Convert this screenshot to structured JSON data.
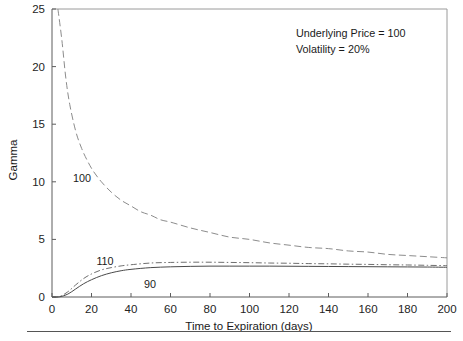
{
  "chart_data": {
    "type": "line",
    "title": "",
    "xlabel": "Time to Expiration (days)",
    "ylabel": "Gamma",
    "xlim": [
      0,
      200
    ],
    "ylim": [
      0,
      25
    ],
    "xticks": [
      0,
      20,
      40,
      60,
      80,
      100,
      120,
      140,
      160,
      180,
      200
    ],
    "yticks": [
      0,
      5,
      10,
      15,
      20,
      25
    ],
    "grid": false,
    "legend_position": "inline-curve-labels",
    "annotations": [
      "Underlying Price = 100",
      "Volatility = 20%"
    ],
    "series": [
      {
        "name": "100",
        "label": "100",
        "style": "dashed",
        "color": "#8c8c8c",
        "x": [
          3,
          5,
          7,
          9,
          12,
          15,
          18,
          21,
          25,
          30,
          35,
          40,
          45,
          50,
          55,
          60,
          70,
          80,
          90,
          100,
          110,
          120,
          130,
          140,
          150,
          160,
          170,
          180,
          190,
          200
        ],
        "y": [
          25.0,
          22.3,
          19.0,
          16.7,
          14.4,
          12.9,
          11.8,
          10.9,
          10.0,
          9.1,
          8.4,
          7.9,
          7.4,
          7.1,
          6.7,
          6.5,
          6.0,
          5.6,
          5.2,
          5.0,
          4.7,
          4.5,
          4.3,
          4.2,
          4.0,
          3.9,
          3.7,
          3.6,
          3.5,
          3.4
        ]
      },
      {
        "name": "110",
        "label": "110",
        "style": "dash-dot",
        "color": "#6f6f6f",
        "x": [
          0,
          4,
          8,
          12,
          16,
          20,
          25,
          30,
          35,
          40,
          50,
          60,
          70,
          80,
          90,
          100,
          110,
          120,
          130,
          140,
          150,
          160,
          170,
          180,
          190,
          200
        ],
        "y": [
          0.0,
          0.05,
          0.45,
          1.05,
          1.6,
          2.0,
          2.35,
          2.55,
          2.7,
          2.8,
          2.95,
          3.0,
          3.02,
          3.02,
          3.0,
          2.98,
          2.95,
          2.93,
          2.9,
          2.88,
          2.85,
          2.83,
          2.8,
          2.78,
          2.75,
          2.72
        ]
      },
      {
        "name": "90",
        "label": "90",
        "style": "solid",
        "color": "#4a4a4a",
        "x": [
          0,
          4,
          8,
          12,
          16,
          20,
          25,
          30,
          35,
          40,
          50,
          60,
          70,
          80,
          90,
          100,
          110,
          120,
          130,
          140,
          150,
          160,
          170,
          180,
          190,
          200
        ],
        "y": [
          0.0,
          0.02,
          0.25,
          0.7,
          1.15,
          1.5,
          1.85,
          2.1,
          2.28,
          2.4,
          2.55,
          2.62,
          2.66,
          2.68,
          2.68,
          2.68,
          2.68,
          2.67,
          2.66,
          2.65,
          2.64,
          2.63,
          2.62,
          2.61,
          2.6,
          2.58
        ]
      }
    ],
    "curve_label_positions": [
      {
        "series": "100",
        "x_px": 82,
        "y_px": 182
      },
      {
        "series": "110",
        "x_px": 105,
        "y_px": 265
      },
      {
        "series": "90",
        "x_px": 150,
        "y_px": 288
      }
    ]
  },
  "axis": {
    "y_title": "Gamma",
    "x_title": "Time to Expiration (days)",
    "y_tick_labels": [
      "0",
      "5",
      "10",
      "15",
      "20",
      "25"
    ],
    "x_tick_labels": [
      "0",
      "20",
      "40",
      "60",
      "80",
      "100",
      "120",
      "140",
      "160",
      "180",
      "200"
    ]
  },
  "annotation": {
    "line1": "Underlying Price = 100",
    "line2": "Volatility = 20%"
  },
  "curve_labels": {
    "atm": "100",
    "otm": "110",
    "itm": "90"
  },
  "colors": {
    "frame": "#9a9a9a",
    "axis": "#5d5d5d",
    "text": "#1a1a1a",
    "series_100": "#8c8c8c",
    "series_110": "#6f6f6f",
    "series_90": "#4a4a4a",
    "background": "#ffffff"
  }
}
